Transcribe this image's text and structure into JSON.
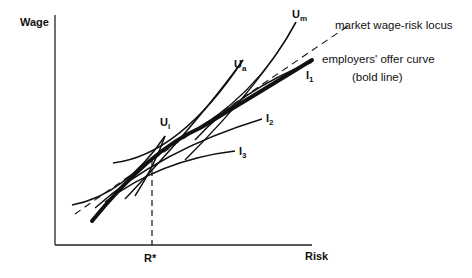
{
  "diagram": {
    "title": "",
    "axes": {
      "y_label": "Wage",
      "x_label": "Risk",
      "x_marker": "R*"
    },
    "labels": {
      "market_locus": "market wage-risk locus",
      "offer_curve_line1": "employers' offer curve",
      "offer_curve_line2": "(bold line)",
      "U_m": {
        "base": "U",
        "sub": "m"
      },
      "U_a": {
        "base": "U",
        "sub": "a"
      },
      "U_i": {
        "base": "U",
        "sub": "i"
      },
      "I_1": {
        "base": "I",
        "sub": "1"
      },
      "I_2": {
        "base": "I",
        "sub": "2"
      },
      "I_3": {
        "base": "I",
        "sub": "3"
      }
    },
    "colors": {
      "ink": "#111111",
      "background": "#ffffff"
    }
  }
}
